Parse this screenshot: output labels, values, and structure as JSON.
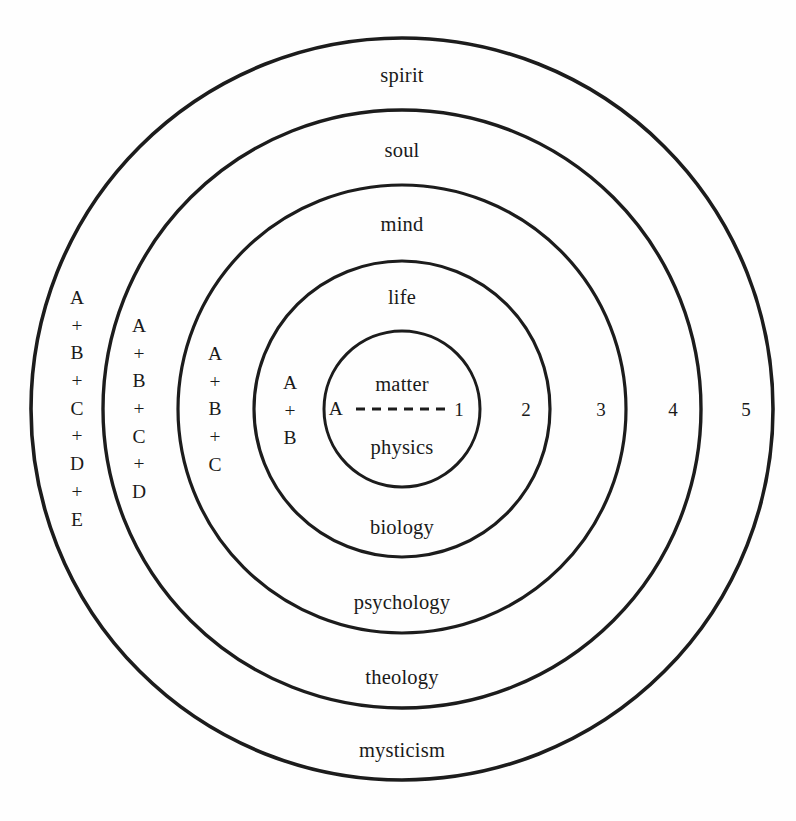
{
  "diagram": {
    "center": {
      "x": 402,
      "y": 409
    },
    "stroke_color": "#1c1c1c",
    "background_color": "#fefefe",
    "rings": [
      {
        "id": "ring-1",
        "radius": 78,
        "stroke_width": 3.0,
        "upper_label": "matter",
        "lower_label": "physics",
        "cumulative_label": "A",
        "number_label": "1"
      },
      {
        "id": "ring-2",
        "radius": 148,
        "stroke_width": 3.2,
        "upper_label": "life",
        "lower_label": "biology",
        "cumulative_label": "A + B",
        "number_label": "2"
      },
      {
        "id": "ring-3",
        "radius": 224,
        "stroke_width": 3.2,
        "upper_label": "mind",
        "lower_label": "psychology",
        "cumulative_label": "A + B + C",
        "number_label": "3"
      },
      {
        "id": "ring-4",
        "radius": 299,
        "stroke_width": 3.4,
        "upper_label": "soul",
        "lower_label": "theology",
        "cumulative_label": "A + B + C + D",
        "number_label": "4"
      },
      {
        "id": "ring-5",
        "radius": 371,
        "stroke_width": 3.6,
        "upper_label": "spirit",
        "lower_label": "mysticism",
        "cumulative_label": "A + B + C + D + E",
        "number_label": "5"
      }
    ],
    "core": {
      "upper_label": "matter",
      "lower_label": "physics",
      "left_letter": "A",
      "right_number": "1",
      "divider": "dashed-horizontal-line"
    },
    "upper_labels": [
      {
        "text": "spirit",
        "x": 402,
        "y": 75
      },
      {
        "text": "soul",
        "x": 402,
        "y": 150
      },
      {
        "text": "mind",
        "x": 402,
        "y": 224
      },
      {
        "text": "life",
        "x": 402,
        "y": 297
      },
      {
        "text": "matter",
        "x": 402,
        "y": 384
      }
    ],
    "lower_labels": [
      {
        "text": "physics",
        "x": 402,
        "y": 447
      },
      {
        "text": "biology",
        "x": 402,
        "y": 527
      },
      {
        "text": "psychology",
        "x": 402,
        "y": 602
      },
      {
        "text": "theology",
        "x": 402,
        "y": 677
      },
      {
        "text": "mysticism",
        "x": 402,
        "y": 750
      }
    ],
    "left_stacks": [
      {
        "id": "stack-abcde",
        "lines": [
          "A",
          "+",
          "B",
          "+",
          "C",
          "+",
          "D",
          "+",
          "E"
        ],
        "x": 77,
        "y": 409
      },
      {
        "id": "stack-abcd",
        "lines": [
          "A",
          "+",
          "B",
          "+",
          "C",
          "+",
          "D"
        ],
        "x": 139,
        "y": 409
      },
      {
        "id": "stack-abc",
        "lines": [
          "A",
          "+",
          "B",
          "+",
          "C"
        ],
        "x": 215,
        "y": 409
      },
      {
        "id": "stack-ab",
        "lines": [
          "A",
          "+",
          "B"
        ],
        "x": 290,
        "y": 411
      }
    ],
    "left_letter": {
      "text": "A",
      "x": 336,
      "y": 409
    },
    "right_numbers": [
      {
        "text": "1",
        "x": 459,
        "y": 409
      },
      {
        "text": "2",
        "x": 526,
        "y": 409
      },
      {
        "text": "3",
        "x": 601,
        "y": 409
      },
      {
        "text": "4",
        "x": 673,
        "y": 409
      },
      {
        "text": "5",
        "x": 746,
        "y": 409
      }
    ]
  }
}
